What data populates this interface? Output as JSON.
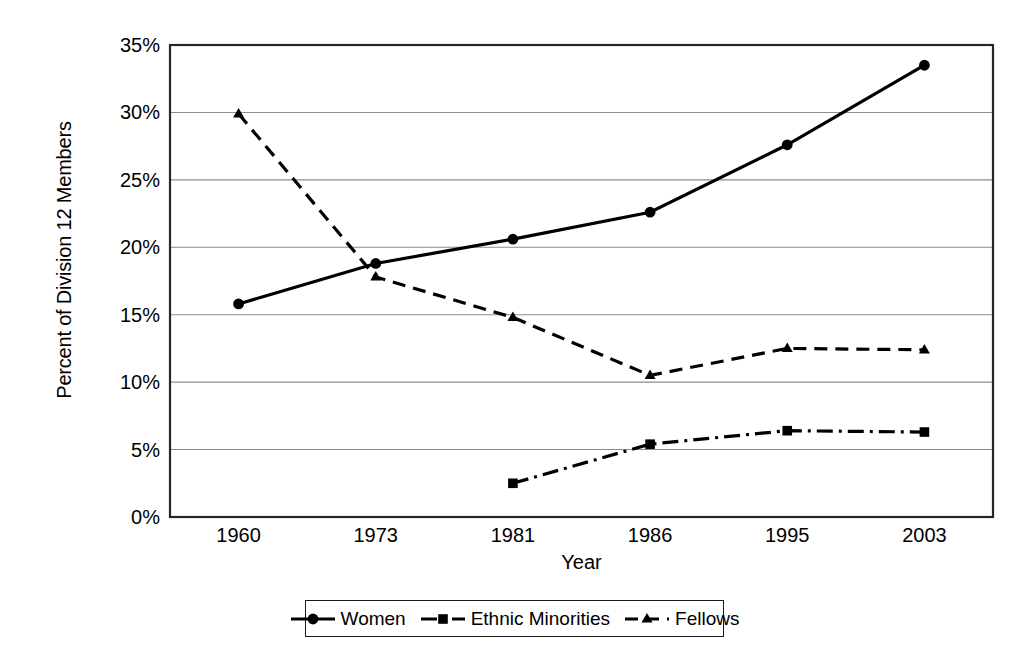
{
  "chart_data": {
    "type": "line",
    "title": "",
    "xlabel": "Year",
    "ylabel": "Percent of Division 12 Members",
    "categories": [
      "1960",
      "1973",
      "1981",
      "1986",
      "1995",
      "2003"
    ],
    "ylim": [
      0,
      35
    ],
    "yticks": [
      "0%",
      "5%",
      "10%",
      "15%",
      "20%",
      "25%",
      "30%",
      "35%"
    ],
    "ytick_values": [
      0,
      5,
      10,
      15,
      20,
      25,
      30,
      35
    ],
    "grid": "horizontal",
    "legend_position": "bottom",
    "series": [
      {
        "name": "Women",
        "marker": "circle",
        "linestyle": "solid",
        "color": "#000000",
        "values": [
          15.8,
          18.8,
          20.6,
          22.6,
          27.6,
          33.5
        ]
      },
      {
        "name": "Ethnic Minorities",
        "marker": "square",
        "linestyle": "dashdot",
        "color": "#000000",
        "values": [
          null,
          null,
          2.5,
          5.4,
          6.4,
          6.3
        ]
      },
      {
        "name": "Fellows",
        "marker": "triangle",
        "linestyle": "dashed",
        "color": "#000000",
        "values": [
          29.9,
          17.8,
          14.8,
          10.5,
          12.5,
          12.4
        ]
      }
    ]
  },
  "axes": {
    "x_title": "Year",
    "y_title": "Percent of Division 12 Members"
  },
  "legend": {
    "items": [
      {
        "label": "Women"
      },
      {
        "label": "Ethnic Minorities"
      },
      {
        "label": "Fellows"
      }
    ]
  },
  "colors": {
    "line": "#000000",
    "grid": "#8c8c8c",
    "frame": "#262626",
    "background": "#ffffff"
  }
}
